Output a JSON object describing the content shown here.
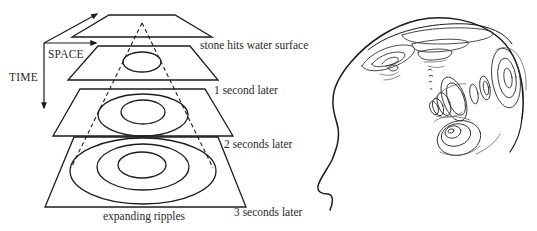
{
  "left_figure": {
    "axes": {
      "space_label": "SPACE",
      "time_label": "TIME"
    },
    "layers": [
      {
        "label": "stone hits water surface",
        "ring_count": 0
      },
      {
        "label": "1 second later",
        "ring_count": 1
      },
      {
        "label": "2 seconds later",
        "ring_count": 2
      },
      {
        "label": "3 seconds later",
        "ring_count": 3
      }
    ],
    "caption": "expanding ripples"
  },
  "right_figure": {
    "subject": "head profile with ripple-like wave patterns inside the brain"
  }
}
